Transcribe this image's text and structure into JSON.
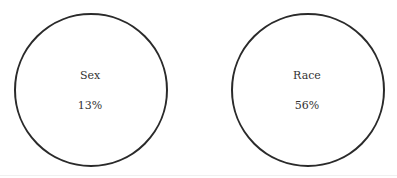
{
  "diagram": {
    "type": "circles",
    "circles": [
      {
        "label": "Sex",
        "value": "13%"
      },
      {
        "label": "Race",
        "value": "56%"
      }
    ],
    "colors": {
      "stroke": "#2a2a2a",
      "text": "#333333",
      "background": "#ffffff"
    }
  }
}
